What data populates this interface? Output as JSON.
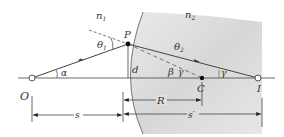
{
  "diagram": {
    "type": "refraction-at-spherical-surface",
    "media": {
      "left": "n1",
      "right": "n2"
    },
    "labels": {
      "n1_main": "n",
      "n1_sub": "1",
      "n2_main": "n",
      "n2_sub": "2",
      "point_P": "P",
      "point_O": "O",
      "point_C": "C",
      "point_I": "I",
      "theta1_main": "θ",
      "theta1_sub": "1",
      "theta2_main": "θ",
      "theta2_sub": "2",
      "alpha": "α",
      "beta": "β",
      "gamma_near_beta": "γ",
      "gamma_near_I": "γ",
      "height_d": "d",
      "dim_s": "s",
      "dim_R": "R",
      "dim_s_prime": "s′"
    },
    "colors": {
      "line": "#444444",
      "shaded_medium": "#d9d9d9",
      "text": "#333333"
    }
  }
}
